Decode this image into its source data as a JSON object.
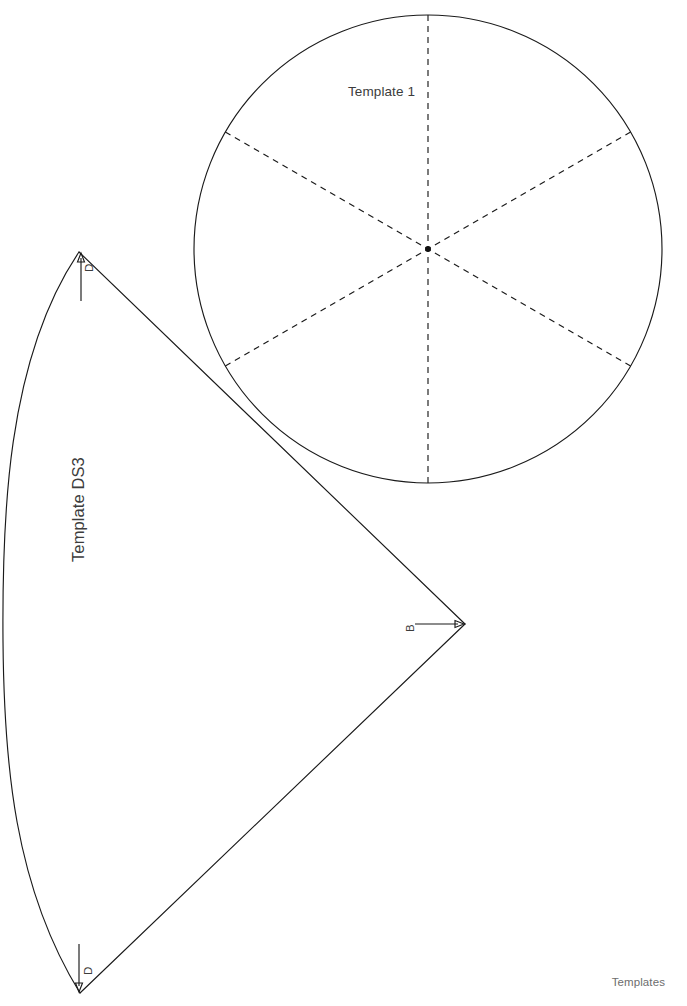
{
  "page": {
    "background_color": "#ffffff",
    "ink_color": "#1a1a1a",
    "text_color": "#3c3c3c",
    "footer_color": "#6d6d6d",
    "width": 687,
    "height": 1006
  },
  "footer": {
    "label": "Templates"
  },
  "shapes": {
    "circle_template": {
      "label": "Template 1",
      "center_x": 428,
      "center_y": 249,
      "radius": 234,
      "outline_style": "solid",
      "division_count": 6,
      "division_style": "dashed",
      "center_mark": "dot",
      "diameter_angles_deg": [
        90,
        30,
        150
      ]
    },
    "sector_template": {
      "label": "Template DS3",
      "label_rotation_deg": -90,
      "arc_center_x": 465,
      "arc_center_y": 624,
      "arc_radius": 465,
      "vertex_top_x": 79,
      "vertex_top_y": 252,
      "vertex_bottom_x": 80,
      "vertex_bottom_y": 993,
      "outline_style": "solid"
    }
  },
  "annotations": [
    {
      "id": "d-top",
      "label": "D",
      "target": "sector-top-vertex",
      "leader_direction": "up",
      "rotation_deg": -90
    },
    {
      "id": "b-vertex",
      "label": "B",
      "target": "sector-arc-center-vertex",
      "leader_direction": "right",
      "rotation_deg": -90
    },
    {
      "id": "d-bottom",
      "label": "D",
      "target": "sector-bottom-vertex",
      "leader_direction": "down",
      "rotation_deg": -90
    }
  ]
}
